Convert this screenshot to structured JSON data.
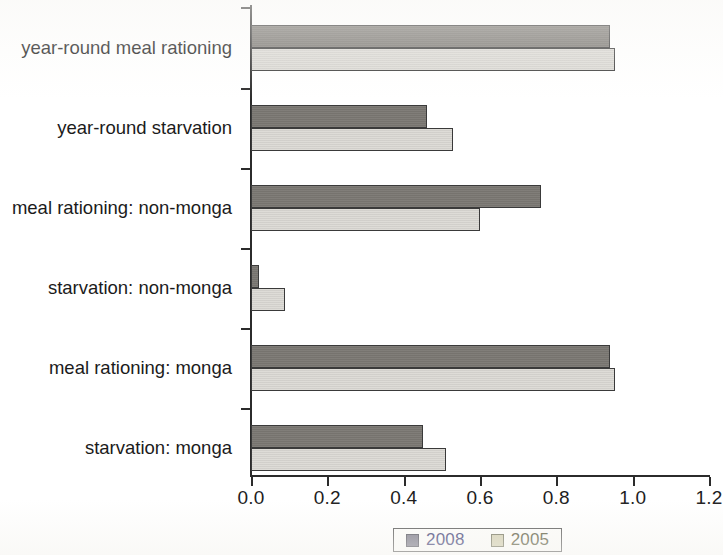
{
  "chart_data": {
    "type": "bar",
    "orientation": "horizontal",
    "title": "",
    "xlabel": "",
    "ylabel": "",
    "xlim": [
      0.0,
      1.2
    ],
    "xticks": [
      "0.0",
      "0.2",
      "0.4",
      "0.6",
      "0.8",
      "1.0",
      "1.2"
    ],
    "xtick_values": [
      0.0,
      0.2,
      0.4,
      0.6,
      0.8,
      1.0,
      1.2
    ],
    "grid": false,
    "legend_position": "bottom",
    "categories": [
      "year-round meal rationing",
      "year-round starvation",
      "meal rationing: non-monga",
      "starvation: non-monga",
      "meal rationing: monga",
      "starvation: monga"
    ],
    "series": [
      {
        "name": "2008",
        "color": "#7b7873",
        "values": [
          0.94,
          0.46,
          0.76,
          0.02,
          0.94,
          0.45
        ]
      },
      {
        "name": "2005",
        "color": "#d9d7d2",
        "values": [
          0.955,
          0.53,
          0.6,
          0.09,
          0.955,
          0.51
        ]
      }
    ]
  },
  "legend": {
    "items": [
      {
        "label": "2008",
        "swatch": "dark-gray-swatch"
      },
      {
        "label": "2005",
        "swatch": "light-gray-swatch"
      }
    ]
  },
  "colors": {
    "series_2008": "#7b7873",
    "series_2005": "#d9d7d2",
    "axis": "#2b2b2b",
    "text": "#1b1b1b",
    "legend_text_2008": "#2c2c6a",
    "legend_text_2005": "#4a4a2c"
  }
}
